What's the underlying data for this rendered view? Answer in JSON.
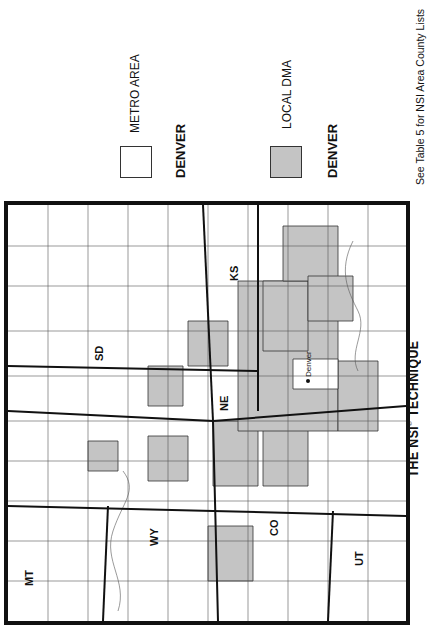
{
  "header": {
    "title_visible": "MARKE",
    "title_faded": "T",
    "title_rest": " TYPE",
    "subtitle": "DMA TV Ratings Estimates",
    "legend_title": "MAP LEGEND"
  },
  "legend": {
    "city_location": "City Location",
    "state_line": "State Line",
    "metro_area": "METRO AREA",
    "metro_market": "DENVER",
    "local_dma": "LOCAL DMA",
    "local_market": "DENVER",
    "local_dma_color": "#c4c4c4",
    "metro_area_color": "#ffffff"
  },
  "note": "See Table 5 for NSI Area County Lists",
  "footer": {
    "title_part1": "THE NSI",
    "registered": "®",
    "title_part2": " TECHNIQUE"
  },
  "map": {
    "states": [
      {
        "code": "MT",
        "label": "MT"
      },
      {
        "code": "WY",
        "label": "WY"
      },
      {
        "code": "SD",
        "label": "SD"
      },
      {
        "code": "NE",
        "label": "NE"
      },
      {
        "code": "CO",
        "label": "CO"
      },
      {
        "code": "KS",
        "label": "KS"
      },
      {
        "code": "UT",
        "label": "UT"
      }
    ],
    "city_marker": "Denver",
    "dma_fill": "#c4c4c4",
    "border_color": "#111111"
  }
}
